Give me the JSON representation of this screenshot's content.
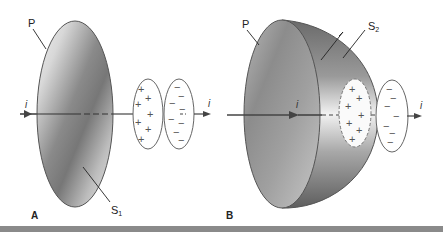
{
  "panels": [
    {
      "id": "A",
      "panel_label": "A",
      "plane_label": "P",
      "surface_label": "S",
      "surface_subscript": "1",
      "current_label_left": "i",
      "current_label_right": "i",
      "plus_signs": [
        "+",
        "+",
        "+",
        "+",
        "+",
        "+",
        "+"
      ],
      "minus_signs": [
        "−",
        "−",
        "−",
        "−",
        "−",
        "−",
        "−",
        "−"
      ]
    },
    {
      "id": "B",
      "panel_label": "B",
      "plane_label": "P",
      "surface_label": "S",
      "surface_subscript": "2",
      "current_label_left": "i",
      "current_label_right": "i",
      "plus_signs": [
        "+",
        "+",
        "+",
        "+",
        "+",
        "+",
        "+"
      ],
      "minus_signs": [
        "−",
        "−",
        "−",
        "−",
        "−",
        "−",
        "−"
      ]
    }
  ],
  "colors": {
    "outline": "#555555",
    "arrow": "#444444",
    "shade_dark": "#6e6e6e",
    "shade_light": "#e6e6e6",
    "bottom_bar": "#8a8a8a"
  }
}
